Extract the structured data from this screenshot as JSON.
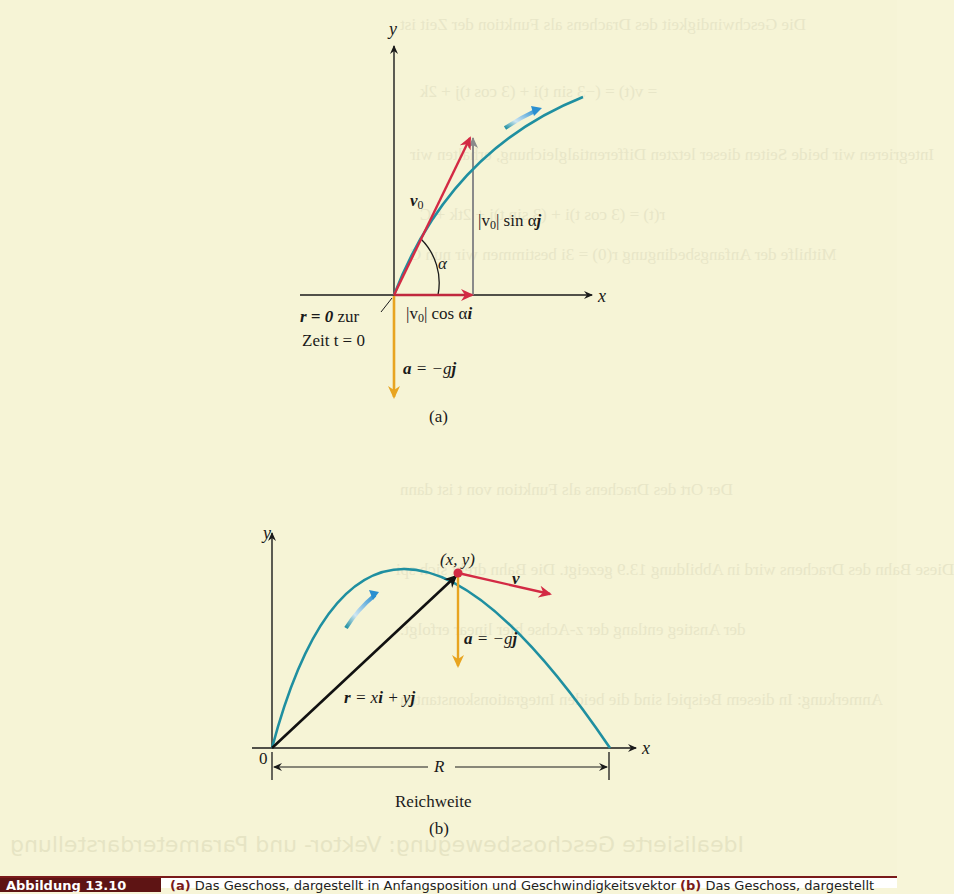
{
  "figure": {
    "panel_a": {
      "axis_x": "x",
      "axis_y": "y",
      "v0_label": "v",
      "v0_sub": "0",
      "alpha": "α",
      "sin_component_pre": "|v",
      "sin_component_sub": "0",
      "sin_component_post": "| sin α",
      "sin_component_vec": "j",
      "cos_component_pre": "|v",
      "cos_component_sub": "0",
      "cos_component_post": "| cos α",
      "cos_component_vec": "i",
      "origin_r": "r = 0",
      "origin_zur": " zur",
      "origin_time": "Zeit t = 0",
      "accel_a": "a",
      "accel_rest": " = −g",
      "accel_j": "j",
      "panel_label": "(a)"
    },
    "panel_b": {
      "axis_x": "x",
      "axis_y": "y",
      "origin": "0",
      "point_label": "(x, y)",
      "velocity": "v",
      "accel_a": "a",
      "accel_rest": " = −g",
      "accel_j": "j",
      "position_r": "r",
      "position_eq": " = x",
      "position_i": "i",
      "position_plus": " + y",
      "position_j": "j",
      "range_label": "R",
      "range_caption": "Reichweite",
      "panel_label": "(b)"
    },
    "colors": {
      "velocity": "#d32a44",
      "trajectory": "#1f8fa0",
      "acceleration": "#e8a420",
      "component": "#8a8a8a",
      "axis": "#1a1a1a",
      "caption_tag_bg": "#5e1414"
    }
  },
  "caption": {
    "tag": "Abbildung 13.10",
    "part_a_marker": "(a)",
    "part_a_text": " Das Geschoss, dargestellt in Anfangsposition und Geschwindigkeitsvektor ",
    "part_b_marker": "(b)",
    "part_b_text": " Das Geschoss, dargestellt"
  }
}
